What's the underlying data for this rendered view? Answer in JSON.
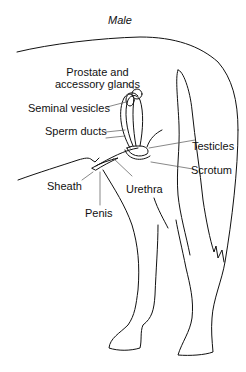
{
  "title": "Male",
  "labels": {
    "prostate": "Prostate and",
    "prostate_line2": "accessory glands",
    "seminal_vesicles": "Seminal vesicles",
    "sperm_ducts": "Sperm ducts",
    "testicles": "Testicles",
    "scrotum": "Scrotum",
    "sheath": "Sheath",
    "urethra": "Urethra",
    "penis": "Penis"
  },
  "colors": {
    "line": "#111111",
    "leader": "#555555",
    "background": "#ffffff"
  }
}
